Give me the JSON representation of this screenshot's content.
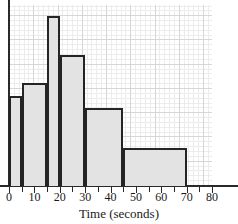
{
  "chart_data": {
    "type": "bar",
    "title": "",
    "subtitle": "",
    "xlabel": "Time (seconds)",
    "ylabel": "",
    "xlim": [
      0,
      80
    ],
    "ylim": [
      0,
      7.5
    ],
    "grid": true,
    "legend": null,
    "note": "Histogram with unequal class widths; bar tops read against the minor grid (1 grid square = 5 px).",
    "xticks": [
      0,
      10,
      20,
      30,
      40,
      50,
      60,
      70,
      80
    ],
    "xtick_labels": [
      "0",
      "10",
      "20",
      "30",
      "40",
      "50",
      "60",
      "70",
      "80"
    ],
    "bins": [
      {
        "label": "0-5",
        "x_start": 0,
        "x_end": 5,
        "height": 3.7
      },
      {
        "label": "5-15",
        "x_start": 5,
        "x_end": 15,
        "height": 4.25
      },
      {
        "label": "15-20",
        "x_start": 15,
        "x_end": 20,
        "height": 7.0
      },
      {
        "label": "20-30",
        "x_start": 20,
        "x_end": 30,
        "height": 5.4
      },
      {
        "label": "30-45",
        "x_start": 30,
        "x_end": 45,
        "height": 3.2
      },
      {
        "label": "45-70",
        "x_start": 45,
        "x_end": 70,
        "height": 1.55
      }
    ],
    "colors": {
      "bar_fill": "#e3e3e3",
      "bar_stroke": "#242424",
      "axis": "#2a2a2a",
      "grid_major": "#d6d6d6",
      "grid_minor": "#ececec",
      "text": "#1a1a1a",
      "background": "#ffffff"
    }
  },
  "axis": {
    "x_title": "Time (seconds)"
  }
}
